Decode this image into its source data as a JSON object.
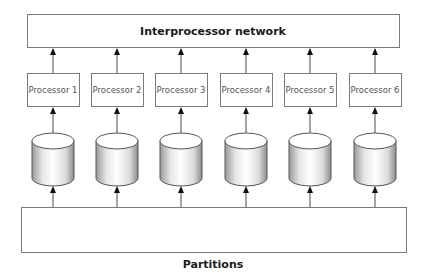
{
  "diagram": {
    "network": {
      "label": "Interprocessor network"
    },
    "processors": [
      {
        "label": "Processor 1"
      },
      {
        "label": "Processor 2"
      },
      {
        "label": "Processor 3"
      },
      {
        "label": "Processor 4"
      },
      {
        "label": "Processor 5"
      },
      {
        "label": "Processor 6"
      }
    ],
    "disks": 6,
    "partitions": {
      "label": "Partitions",
      "count": 6
    }
  }
}
